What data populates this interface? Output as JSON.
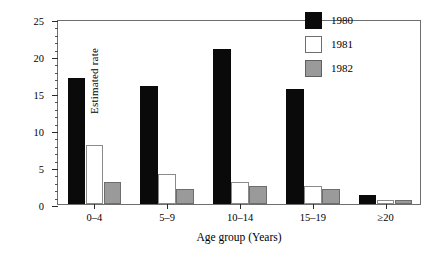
{
  "chart_data": {
    "type": "bar",
    "title": "",
    "xlabel": "Age group (Years)",
    "ylabel": "Estimated rate",
    "categories": [
      "0–4",
      "5–9",
      "10–14",
      "15–19",
      "≥20"
    ],
    "series": [
      {
        "name": "1980",
        "color": "#0a0a0a",
        "values": [
          17.0,
          16.0,
          21.0,
          15.5,
          1.2
        ]
      },
      {
        "name": "1981",
        "color": "#ffffff",
        "values": [
          8.0,
          4.0,
          3.0,
          2.5,
          0.6
        ]
      },
      {
        "name": "1982",
        "color": "#9a9a9a",
        "values": [
          3.0,
          2.0,
          2.5,
          2.0,
          0.6
        ]
      }
    ],
    "ylim": [
      0,
      25
    ],
    "ytick_labels": [
      "0",
      "5",
      "10",
      "15",
      "20",
      "25"
    ],
    "ytick_values": [
      0,
      5,
      10,
      15,
      20,
      25
    ],
    "yminor_step": 1,
    "grid": false,
    "legend_position": "top-right"
  }
}
